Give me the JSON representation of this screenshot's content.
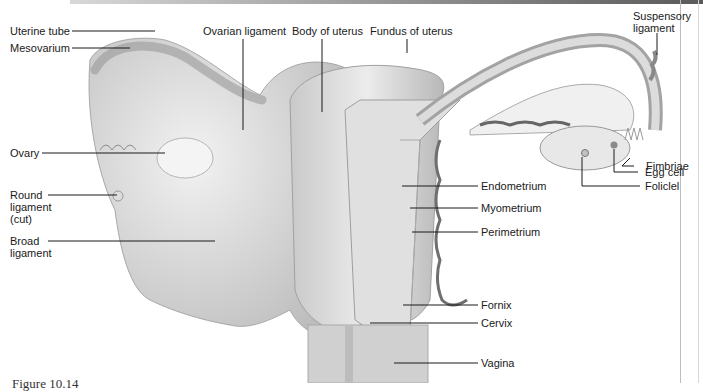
{
  "figure": {
    "caption": "Figure 10.14"
  },
  "labels": {
    "uterine_tube": "Uterine tube",
    "mesovarium": "Mesovarium",
    "ovary": "Ovary",
    "round_ligament_1": "Round",
    "round_ligament_2": "ligament",
    "round_ligament_3": "(cut)",
    "broad_ligament_1": "Broad",
    "broad_ligament_2": "ligament",
    "ovarian_ligament": "Ovarian ligament",
    "body_of_uterus": "Body of uterus",
    "fundus_of_uterus": "Fundus of uterus",
    "suspensory_ligament_1": "Suspensory",
    "suspensory_ligament_2": "ligament",
    "fimbriae": "Fimbriae",
    "egg_cell": "Egg cell",
    "follicle": "Foliclel",
    "endometrium": "Endometrium",
    "myometrium": "Myometrium",
    "perimetrium": "Perimetrium",
    "fornix": "Fornix",
    "cervix": "Cervix",
    "vagina": "Vagina"
  }
}
